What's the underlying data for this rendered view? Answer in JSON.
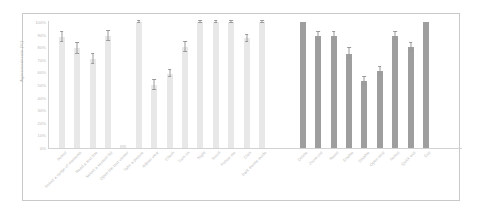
{
  "figure": {
    "ylabel": "Agreement rate (%)",
    "y_ticks": [
      "100%",
      "90%",
      "80%",
      "70%",
      "60%",
      "50%",
      "40%",
      "30%",
      "20%",
      "10%",
      "0%"
    ],
    "colors": {
      "bar_light": "#e8e8e8",
      "bar_dark": "#9e9e9e",
      "error_bar": "#9a9a9a",
      "axis": "#d2d2d2",
      "tick_text": "#b9b9b9",
      "frame": "#c9c9c9",
      "background": "#ffffff"
    }
  },
  "chart_data": {
    "type": "bar",
    "title": "",
    "xlabel": "",
    "ylabel": "Agreement rate (%)",
    "ylim": [
      0,
      100
    ],
    "ytick_values": [
      0,
      10,
      20,
      30,
      40,
      50,
      60,
      70,
      80,
      90,
      100
    ],
    "grid": false,
    "legend": null,
    "groups": [
      {
        "name": "group-1",
        "color": "#e8e8e8",
        "categories": [
          "Select",
          "Select a range of elements",
          "Read a text line",
          "Select a section list",
          "Open the text viewer",
          "Take a picture",
          "Adjust view",
          "Check",
          "Turn on",
          "Night",
          "Scroll",
          "Follow me",
          "Click",
          "Dark theme mode"
        ],
        "values": [
          88,
          79,
          71,
          89,
          2,
          100,
          50,
          59,
          80,
          100,
          100,
          100,
          87,
          100
        ],
        "errors": [
          4,
          4,
          4,
          4,
          0,
          1,
          4,
          3,
          4,
          1,
          1,
          1,
          3,
          1
        ]
      },
      {
        "name": "group-2",
        "color": "#9e9e9e",
        "categories": [
          "Delete",
          "Zoom out",
          "Reset",
          "Enable",
          "Disable",
          "Open next",
          "Select",
          "Quick exit",
          "Exit"
        ],
        "values": [
          100,
          89,
          89,
          75,
          53,
          61,
          89,
          80,
          100
        ],
        "errors": [
          0,
          3,
          3,
          4,
          3,
          3,
          3,
          3,
          0
        ]
      }
    ]
  }
}
